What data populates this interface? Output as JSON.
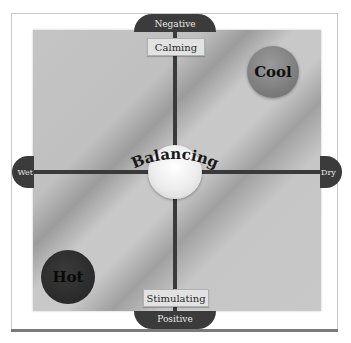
{
  "diagram": {
    "type": "quadrant-balance-chart",
    "axes": {
      "top": "Negative",
      "bottom": "Positive",
      "left": "Wet",
      "right": "Dry"
    },
    "tags": {
      "top": "Calming",
      "bottom": "Stimulating"
    },
    "nodes": {
      "center": "Balancing",
      "top_right": "Cool",
      "bottom_left": "Hot"
    },
    "colors": {
      "panel": "#c4c4c4",
      "axis": "#3a3a3a",
      "dome": "#3b3b3b",
      "cool": "#8a8a8a",
      "hot": "#2a2a2a",
      "center": "#f0f0f0"
    }
  }
}
